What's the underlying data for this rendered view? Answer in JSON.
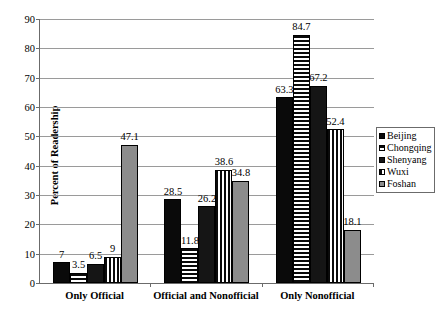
{
  "chart_data": {
    "type": "bar",
    "title": "",
    "xlabel": "",
    "ylabel": "Percent of Readership",
    "ylim": [
      0,
      90
    ],
    "ytick_step": 10,
    "yticks": [
      0,
      10,
      20,
      30,
      40,
      50,
      60,
      70,
      80,
      90
    ],
    "grid": true,
    "legend_position": "right",
    "categories": [
      "Only Official",
      "Official and Nonofficial",
      "Only Nonofficial"
    ],
    "series": [
      {
        "name": "Beijing",
        "values": [
          7,
          28.5,
          63.3
        ],
        "labels": [
          "7",
          "28.5",
          "63.3"
        ],
        "pattern": "solid-black"
      },
      {
        "name": "Chongqing",
        "values": [
          3.5,
          11.8,
          84.7
        ],
        "labels": [
          "3.5",
          "11.8",
          "84.7"
        ],
        "pattern": "horizontal-stripe"
      },
      {
        "name": "Shenyang",
        "values": [
          6.5,
          26.2,
          67.2
        ],
        "labels": [
          "6.5",
          "26.2",
          "67.2"
        ],
        "pattern": "solid-dark"
      },
      {
        "name": "Wuxi",
        "values": [
          9,
          38.6,
          52.4
        ],
        "labels": [
          "9",
          "38.6",
          "52.4"
        ],
        "pattern": "vertical-stripe"
      },
      {
        "name": "Foshan",
        "values": [
          47.1,
          34.8,
          18.1
        ],
        "labels": [
          "47.1",
          "34.8",
          "18.1"
        ],
        "pattern": "solid-gray"
      }
    ]
  },
  "axis": {
    "y_title": "Percent of Readership"
  },
  "legend": {
    "items": [
      {
        "label": "Beijing"
      },
      {
        "label": "Chongqing"
      },
      {
        "label": "Shenyang"
      },
      {
        "label": "Wuxi"
      },
      {
        "label": "Foshan"
      }
    ]
  },
  "colors": {
    "beijing": "#0a0a0a",
    "chongqing_stripe": "#0a0a0a",
    "shenyang": "#151515",
    "wuxi_stripe": "#0a0a0a",
    "foshan": "#8c8c8c",
    "gridline": "#9a9a9a",
    "axis": "#6b6b6b",
    "background": "#ffffff"
  }
}
